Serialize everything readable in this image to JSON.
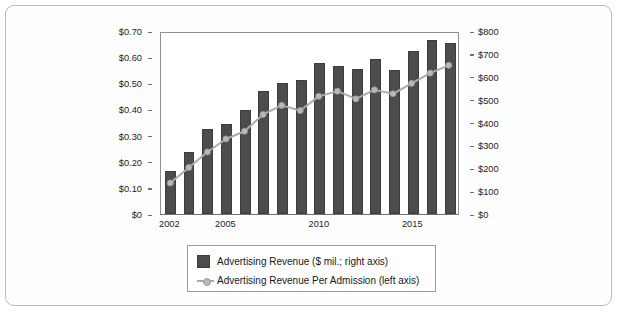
{
  "chart_data": {
    "type": "bar",
    "title": "",
    "xlabel": "",
    "ylabel": "",
    "grid": false,
    "legend_position": "bottom",
    "x": [
      2002,
      2003,
      2004,
      2005,
      2006,
      2007,
      2008,
      2009,
      2010,
      2011,
      2012,
      2013,
      2014,
      2015,
      2016,
      2017
    ],
    "categories": [
      "2002",
      "2003",
      "2004",
      "2005",
      "2006",
      "2007",
      "2008",
      "2009",
      "2010",
      "2011",
      "2012",
      "2013",
      "2014",
      "2015",
      "2016",
      "2017"
    ],
    "xtick_labels": [
      "2002",
      "2005",
      "2010",
      "2015"
    ],
    "xtick_values": [
      2002,
      2005,
      2010,
      2015
    ],
    "axes": {
      "left": {
        "label": "Advertising Revenue Per Admission (left axis)",
        "ylim": [
          0,
          0.7
        ],
        "ticks": [
          0,
          0.1,
          0.2,
          0.3,
          0.4,
          0.5,
          0.6,
          0.7
        ],
        "tick_labels": [
          "$0",
          "$0.10",
          "$0.20",
          "$0.30",
          "$0.40",
          "$0.50",
          "$0.60",
          "$0.70"
        ]
      },
      "right": {
        "label": "Advertising Revenue ($ mil.; right axis)",
        "ylim": [
          0,
          800
        ],
        "ticks": [
          0,
          100,
          200,
          300,
          400,
          500,
          600,
          700,
          800
        ],
        "tick_labels": [
          "$0",
          "$100",
          "$200",
          "$300",
          "$400",
          "$500",
          "$600",
          "$700",
          "$800"
        ]
      }
    },
    "series": [
      {
        "name": "Advertising Revenue ($ mil.; right axis)",
        "type": "bar",
        "axis": "right",
        "unit": "$ mil.",
        "color": "#4c4c4c",
        "values": [
          186,
          272,
          370,
          394,
          456,
          536,
          572,
          584,
          660,
          648,
          636,
          676,
          628,
          712,
          760,
          748
        ]
      },
      {
        "name": "Advertising Revenue Per Admission (left axis)",
        "type": "line",
        "axis": "left",
        "unit": "$ per admission",
        "color": "#a9acae",
        "values": [
          0.12,
          0.18,
          0.24,
          0.29,
          0.32,
          0.385,
          0.42,
          0.4,
          0.455,
          0.475,
          0.445,
          0.48,
          0.465,
          0.505,
          0.545,
          0.575
        ]
      }
    ]
  },
  "legend": {
    "entries": [
      {
        "label": "Advertising Revenue ($ mil.; right axis)",
        "marker": "square-swatch",
        "color": "#4c4c4c"
      },
      {
        "label": "Advertising Revenue Per Admission (left axis)",
        "marker": "line-with-dot",
        "color": "#a9acae"
      }
    ]
  },
  "colors": {
    "bar": "#4c4c4c",
    "line": "#a9acae",
    "marker_fill": "#b6b9bb",
    "axis": "#6f7274",
    "frame_border": "#b9bcbe",
    "background": "#ffffff",
    "text": "#15181c"
  }
}
